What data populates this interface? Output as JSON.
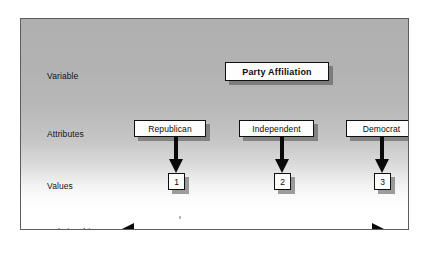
{
  "diagram": {
    "type": "variable-attributes-values",
    "row_labels": {
      "variable": "Variable",
      "attributes": "Attributes",
      "values": "Values",
      "relationship": "Relationship"
    },
    "variable": {
      "label": "Party Affiliation"
    },
    "attributes": [
      {
        "label": "Republican",
        "value": "1"
      },
      {
        "label": "Independent",
        "value": "2"
      },
      {
        "label": "Democrat",
        "value": "3"
      }
    ],
    "relationship": {
      "arrow": "double-headed-horizontal-arrow"
    },
    "colors": {
      "box_fill": "#fdfdfd",
      "box_border": "#101010",
      "shadow": "#5a5a5a",
      "arrow": "#0a0a0a",
      "text": "#0c0c0c",
      "panel_border": "#5d5d5d",
      "panel_top": "#b0b0b0",
      "panel_bottom": "#ffffff",
      "page_background": "#ffffff"
    }
  }
}
